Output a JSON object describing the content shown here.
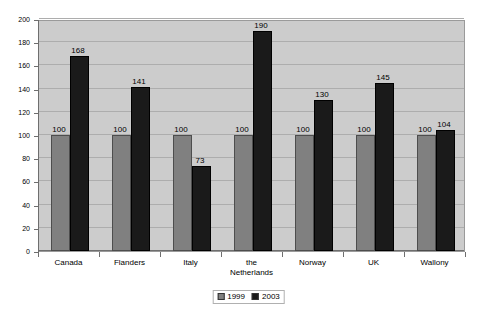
{
  "chart_data": {
    "type": "bar",
    "title": "",
    "subtitle": "",
    "xlabel": "",
    "ylabel": "",
    "ylim": [
      0,
      200
    ],
    "ytick_step": 20,
    "yticks": [
      "0",
      "20",
      "40",
      "60",
      "80",
      "100",
      "120",
      "140",
      "160",
      "180",
      "200"
    ],
    "grid": true,
    "legend_position": "bottom-center",
    "categories": [
      "Canada",
      "Flanders",
      "Italy",
      "the Netherlands",
      "Norway",
      "UK",
      "Wallony"
    ],
    "category_lines": [
      [
        "Canada"
      ],
      [
        "Flanders"
      ],
      [
        "Italy"
      ],
      [
        "the",
        "Netherlands"
      ],
      [
        "Norway"
      ],
      [
        "UK"
      ],
      [
        "Wallony"
      ]
    ],
    "series": [
      {
        "name": "1999",
        "color": "#808080",
        "values": [
          100,
          100,
          100,
          100,
          100,
          100,
          100
        ],
        "labels": [
          "100",
          "100",
          "100",
          "100",
          "100",
          "100",
          "100"
        ]
      },
      {
        "name": "2003",
        "color": "#1a1a1a",
        "values": [
          168,
          141,
          73,
          190,
          130,
          145,
          104
        ],
        "labels": [
          "168",
          "141",
          "73",
          "190",
          "130",
          "145",
          "104"
        ]
      }
    ]
  },
  "legend": {
    "entries": [
      {
        "label": "1999",
        "color": "#808080"
      },
      {
        "label": "2003",
        "color": "#1a1a1a"
      }
    ]
  },
  "colors": {
    "plot_background": "#cccccc",
    "gridline": "#adadad",
    "axis": "#6e6e6e",
    "series_1999": "#808080",
    "series_2003": "#1a1a1a",
    "page_background": "#ffffff"
  }
}
